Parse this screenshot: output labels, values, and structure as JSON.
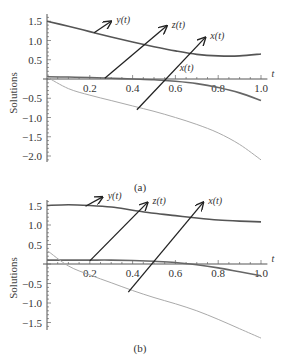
{
  "chart_data": [
    {
      "type": "line",
      "panel_label": "(a)",
      "ylabel": "Solutions",
      "xlabel": "t",
      "xlim": [
        0,
        1.0
      ],
      "ylim": [
        -2.1,
        1.6
      ],
      "x_ticks": [
        "0.2",
        "0.4",
        "0.6",
        "0.8",
        "1.0"
      ],
      "y_ticks": [
        "1.5",
        "1.0",
        "0.5",
        "-0.5",
        "-1.0",
        "-1.5",
        "-2.0"
      ],
      "grid": false,
      "legend": "none (arrow annotations)",
      "x": [
        0,
        0.1,
        0.2,
        0.3,
        0.4,
        0.5,
        0.6,
        0.7,
        0.8,
        0.9,
        1.0
      ],
      "series": [
        {
          "name": "y(t)",
          "color": "#555555",
          "values": [
            1.5,
            1.37,
            1.23,
            1.09,
            0.96,
            0.84,
            0.73,
            0.64,
            0.6,
            0.6,
            0.65
          ]
        },
        {
          "name": "z(t)",
          "color": "#666666",
          "values": [
            0.06,
            0.05,
            0.04,
            0.02,
            0.0,
            -0.02,
            -0.06,
            -0.12,
            -0.22,
            -0.36,
            -0.56
          ]
        },
        {
          "name": "x(t)",
          "color": "#aaaaaa",
          "values": [
            0.05,
            -0.25,
            -0.42,
            -0.56,
            -0.7,
            -0.84,
            -1.0,
            -1.18,
            -1.4,
            -1.7,
            -2.1
          ]
        }
      ],
      "annotations": [
        {
          "text": "y(t)",
          "arrow_from": [
            0.22,
            1.2
          ],
          "arrow_to": [
            0.3,
            1.5
          ]
        },
        {
          "text": "z(t)",
          "arrow_from": [
            0.27,
            0.02
          ],
          "arrow_to": [
            0.56,
            1.38
          ]
        },
        {
          "text": "x(t)",
          "arrow_from": [
            0.42,
            -0.8
          ],
          "arrow_to": [
            0.74,
            1.08
          ]
        },
        {
          "text": "x(t)",
          "position": [
            0.62,
            0.22
          ]
        }
      ]
    },
    {
      "type": "line",
      "panel_label": "(b)",
      "ylabel": "Solutions",
      "xlabel": "t",
      "xlim": [
        0,
        1.0
      ],
      "ylim": [
        -1.9,
        1.6
      ],
      "x_ticks": [
        "0.2",
        "0.4",
        "0.6",
        "0.8",
        "1.0"
      ],
      "y_ticks": [
        "1.5",
        "1.0",
        "0.5",
        "-0.5",
        "-1.0",
        "-1.5"
      ],
      "grid": false,
      "legend": "none (arrow annotations)",
      "x": [
        0,
        0.1,
        0.2,
        0.3,
        0.4,
        0.5,
        0.6,
        0.7,
        0.8,
        0.9,
        1.0
      ],
      "series": [
        {
          "name": "y(t)",
          "color": "#555555",
          "values": [
            1.5,
            1.52,
            1.5,
            1.46,
            1.38,
            1.3,
            1.24,
            1.18,
            1.13,
            1.1,
            1.08
          ]
        },
        {
          "name": "z(t)",
          "color": "#666666",
          "values": [
            0.1,
            0.1,
            0.1,
            0.1,
            0.09,
            0.07,
            0.04,
            -0.02,
            -0.1,
            -0.2,
            -0.3
          ]
        },
        {
          "name": "x(t)",
          "color": "#aaaaaa",
          "values": [
            0.35,
            -0.05,
            -0.28,
            -0.48,
            -0.68,
            -0.86,
            -1.02,
            -1.2,
            -1.42,
            -1.66,
            -1.9
          ]
        }
      ],
      "annotations": [
        {
          "text": "y(t)",
          "arrow_from": [
            0.18,
            1.48
          ],
          "arrow_to": [
            0.26,
            1.72
          ]
        },
        {
          "text": "z(t)",
          "arrow_from": [
            0.2,
            0.08
          ],
          "arrow_to": [
            0.47,
            1.58
          ]
        },
        {
          "text": "x(t)",
          "arrow_from": [
            0.38,
            -0.72
          ],
          "arrow_to": [
            0.73,
            1.58
          ]
        }
      ]
    }
  ]
}
